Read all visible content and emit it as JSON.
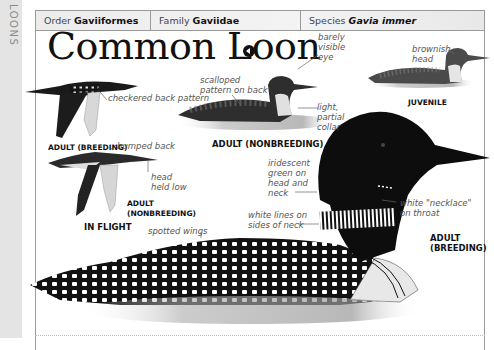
{
  "sidebar": {
    "section_label": "LOONS"
  },
  "taxonomy": {
    "order_label": "Order",
    "order_value": "Gaviiformes",
    "family_label": "Family",
    "family_value": "Gaviidae",
    "species_label": "Species",
    "species_value": "Gavia immer"
  },
  "title": "Common Loon",
  "audio_icon": "speaker-icon",
  "illustrations": {
    "flight_breeding": {
      "caption": "ADULT (BREEDING)",
      "labels": [
        "checkered back pattern"
      ]
    },
    "flight_nonbreeding": {
      "caption": "ADULT (NONBREEDING)",
      "labels": [
        "humped back",
        "head held low"
      ]
    },
    "flight_group_caption": "IN FLIGHT",
    "swimming_nonbreeding": {
      "caption": "ADULT (NONBREEDING)",
      "labels": [
        "scalloped pattern on back",
        "barely visible eye",
        "light, partial collar"
      ]
    },
    "juvenile": {
      "caption": "JUVENILE",
      "labels": [
        "brownish head"
      ]
    },
    "adult_breeding": {
      "caption_line1": "ADULT",
      "caption_line2": "(BREEDING)",
      "labels": [
        "iridescent green on head and neck",
        "white \"necklace\" on throat",
        "white lines on sides of neck",
        "spotted wings"
      ]
    }
  },
  "colors": {
    "sidebar_bg": "#e4e4e4",
    "border": "#9a9a9a",
    "ink": "#111111",
    "label": "#555555"
  }
}
